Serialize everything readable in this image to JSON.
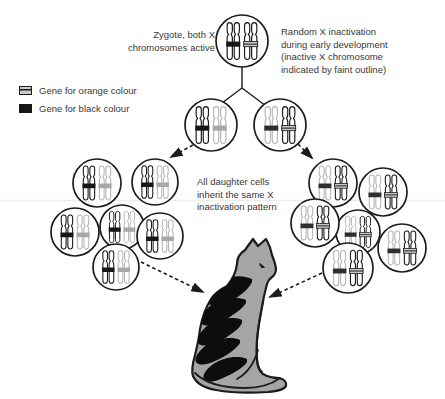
{
  "figure": {
    "topic": "Random X inactivation in the cat",
    "zygote_label": "Zygote, both X\nchromosomes active",
    "random_label": "Random X inactivation\nduring early development\n(inactive X chromosome\nindicated by faint outline)",
    "daughter_label": "All daughter cells\ninherit the same X\ninactivation pattern"
  },
  "legend": {
    "items": [
      {
        "swatch": "orange-hatched",
        "label": "Gene for orange colour"
      },
      {
        "swatch": "black-solid",
        "label": "Gene for black colour"
      }
    ]
  },
  "colors": {
    "ink": "#1c1c1c",
    "faint_outline": "#b7b7b7",
    "band_black": "#161616",
    "band_hatch_bg": "#c9c9c9",
    "band_inactive_gray": "#a8a8a8",
    "band_inactive_dark": "#2e2e2e",
    "cell_fill": "#ffffff",
    "cat_body": "#a5a5a5",
    "cat_stripes": "#0d0d0d",
    "text": "#383838",
    "artifact_line": "#ededed"
  },
  "diagram": {
    "cell_types": {
      "both-active": [
        "active-black",
        "active-orange"
      ],
      "orange-inactive": [
        "active-black",
        "inactive-orange"
      ],
      "black-inactive": [
        "inactive-black",
        "active-orange"
      ]
    },
    "cells": [
      {
        "name": "zygote",
        "cx": 242,
        "cy": 41,
        "r": 26,
        "type": "both-active"
      },
      {
        "name": "progenitor-left",
        "cx": 211,
        "cy": 125,
        "r": 26,
        "type": "orange-inactive"
      },
      {
        "name": "progenitor-right",
        "cx": 280,
        "cy": 125,
        "r": 26,
        "type": "black-inactive"
      },
      {
        "name": "left-cluster-center",
        "cx": 122,
        "cy": 227,
        "r": 22,
        "type": "orange-inactive"
      },
      {
        "name": "left-cluster-topleft",
        "cx": 97,
        "cy": 183,
        "r": 24,
        "type": "orange-inactive"
      },
      {
        "name": "left-cluster-topright",
        "cx": 155,
        "cy": 182,
        "r": 23,
        "type": "orange-inactive"
      },
      {
        "name": "left-cluster-midleft",
        "cx": 75,
        "cy": 232,
        "r": 24,
        "type": "orange-inactive"
      },
      {
        "name": "left-cluster-midright",
        "cx": 160,
        "cy": 236,
        "r": 23,
        "type": "orange-inactive"
      },
      {
        "name": "left-cluster-bottom",
        "cx": 116,
        "cy": 267,
        "r": 23,
        "type": "orange-inactive"
      },
      {
        "name": "right-cluster-center",
        "cx": 358,
        "cy": 232,
        "r": 22,
        "type": "black-inactive"
      },
      {
        "name": "right-cluster-topright",
        "cx": 383,
        "cy": 192,
        "r": 24,
        "type": "black-inactive"
      },
      {
        "name": "right-cluster-topleft",
        "cx": 333,
        "cy": 183,
        "r": 24,
        "type": "black-inactive"
      },
      {
        "name": "right-cluster-midleft",
        "cx": 315,
        "cy": 223,
        "r": 24,
        "type": "black-inactive"
      },
      {
        "name": "right-cluster-right",
        "cx": 402,
        "cy": 248,
        "r": 24,
        "type": "black-inactive"
      },
      {
        "name": "right-cluster-bottom",
        "cx": 348,
        "cy": 268,
        "r": 25,
        "type": "black-inactive"
      }
    ],
    "connectors": [
      [
        242,
        66,
        242,
        88
      ],
      [
        242,
        88,
        214,
        109
      ],
      [
        242,
        88,
        270,
        109
      ]
    ],
    "arrows": [
      [
        193,
        145,
        171,
        157
      ],
      [
        298,
        144,
        312,
        158
      ],
      [
        141,
        262,
        203,
        292
      ],
      [
        322,
        273,
        270,
        297
      ]
    ]
  }
}
